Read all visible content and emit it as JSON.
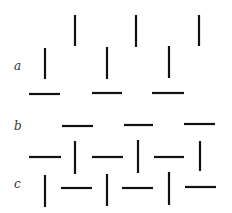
{
  "labels": [
    {
      "text": "a",
      "x": 14,
      "y": 59
    },
    {
      "text": "b",
      "x": 14,
      "y": 119
    },
    {
      "text": "c",
      "x": 14,
      "y": 177
    }
  ],
  "stroke_color": "#111111",
  "lines": [
    [
      75,
      15,
      75,
      46
    ],
    [
      136,
      15,
      136,
      47
    ],
    [
      199,
      15,
      199,
      46
    ],
    [
      45,
      48,
      45,
      79
    ],
    [
      107,
      47,
      107,
      79
    ],
    [
      169,
      46,
      169,
      78
    ],
    [
      29,
      94,
      60,
      94
    ],
    [
      92,
      93,
      122,
      93
    ],
    [
      152,
      93,
      184,
      93
    ],
    [
      62,
      126,
      93,
      126
    ],
    [
      124,
      125,
      153,
      125
    ],
    [
      184,
      124,
      215,
      124
    ],
    [
      29,
      157,
      61,
      157
    ],
    [
      92,
      157,
      123,
      157
    ],
    [
      154,
      157,
      184,
      157
    ],
    [
      75,
      141,
      75,
      174
    ],
    [
      138,
      140,
      138,
      173
    ],
    [
      200,
      141,
      200,
      171
    ],
    [
      45,
      175,
      45,
      207
    ],
    [
      107,
      174,
      107,
      206
    ],
    [
      169,
      172,
      169,
      205
    ],
    [
      61,
      188,
      92,
      188
    ],
    [
      122,
      188,
      153,
      188
    ],
    [
      185,
      187,
      216,
      187
    ]
  ]
}
